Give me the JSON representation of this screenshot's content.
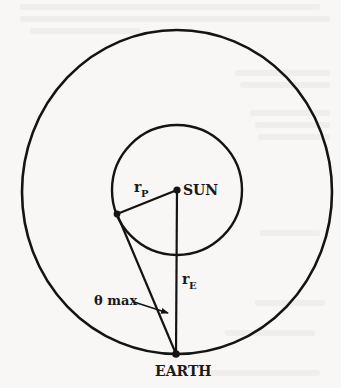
{
  "diagram": {
    "labels": {
      "sun": "SUN",
      "earth": "EARTH",
      "r_planet_main": "r",
      "r_planet_sub": "P",
      "r_earth_main": "r",
      "r_earth_sub": "E",
      "theta_max": "θ max"
    },
    "geometry": {
      "outer_orbit": {
        "cx": 177,
        "cy": 192,
        "rx": 155,
        "ry": 162
      },
      "inner_orbit": {
        "cx": 177,
        "cy": 190,
        "r": 65
      },
      "sun": {
        "x": 177,
        "y": 190
      },
      "planet": {
        "x": 117,
        "y": 214
      },
      "earth": {
        "x": 176,
        "y": 354
      }
    },
    "colors": {
      "stroke": "#141414",
      "background": "#f8f7f5"
    }
  }
}
